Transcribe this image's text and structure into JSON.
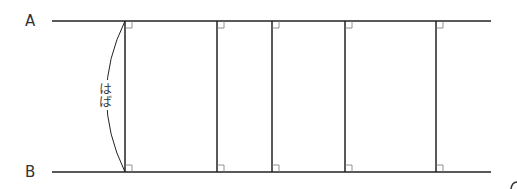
{
  "diagram": {
    "labels": {
      "top_line": "A",
      "bottom_line": "B",
      "width": "はば",
      "corner_partial": "6"
    },
    "lines": {
      "top_y": 21,
      "bottom_y": 172,
      "x_start": 52,
      "x_end": 491
    },
    "perpendiculars_x": [
      125,
      217,
      272,
      345,
      436
    ],
    "line_color": "#222222",
    "right_angle_marks": true
  }
}
